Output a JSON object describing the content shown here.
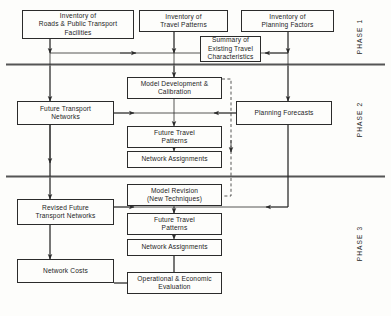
{
  "diagram": {
    "phases": [
      {
        "id": "phase1",
        "label": "PHASE 1"
      },
      {
        "id": "phase2",
        "label": "PHASE 2"
      },
      {
        "id": "phase3",
        "label": "PHASE 3"
      }
    ],
    "boxes": [
      {
        "id": "inventory_roads",
        "label": "Inventory of\nRoads & Public Transport\nFacilities",
        "line1": "Inventory of",
        "line2": "Roads & Public Transport",
        "line3": "Facilities",
        "x": 22,
        "y": 10,
        "w": 112,
        "h": 29
      },
      {
        "id": "inventory_travel",
        "label": "Inventory of\nTravel Patterns",
        "line1": "Inventory of",
        "line2": "Travel Patterns",
        "line3": "",
        "x": 139,
        "y": 10,
        "w": 89,
        "h": 22
      },
      {
        "id": "inventory_planning",
        "label": "Inventory of\nPlanning Factors",
        "line1": "Inventory of",
        "line2": "Planning Factors",
        "line3": "",
        "x": 241,
        "y": 10,
        "w": 93,
        "h": 22
      },
      {
        "id": "summary_existing",
        "label": "Summary of\nExisting Travel\nCharacteristics",
        "line1": "Summary of",
        "line2": "Existing Travel",
        "line3": "Characteristics",
        "x": 200,
        "y": 36,
        "w": 61,
        "h": 26
      },
      {
        "id": "model_dev",
        "label": "Model Development &\nCalibration",
        "line1": "Model Development &",
        "line2": "Calibration",
        "line3": "",
        "x": 127,
        "y": 77,
        "w": 95,
        "h": 22
      },
      {
        "id": "future_transport_networks",
        "label": "Future Transport\nNetworks",
        "line1": "Future Transport",
        "line2": "Networks",
        "line3": "",
        "x": 17,
        "y": 101,
        "w": 97,
        "h": 24
      },
      {
        "id": "planning_forecasts",
        "label": "Planning Forecasts",
        "line1": "Planning Forecasts",
        "line2": "",
        "line3": "",
        "x": 236,
        "y": 101,
        "w": 96,
        "h": 24
      },
      {
        "id": "future_travel_patterns_p2",
        "label": "Future Travel\nPatterns",
        "line1": "Future Travel",
        "line2": "Patterns",
        "line3": "",
        "x": 127,
        "y": 126,
        "w": 95,
        "h": 22
      },
      {
        "id": "network_assignments_p2",
        "label": "Network Assignments",
        "line1": "Network Assignments",
        "line2": "",
        "line3": "",
        "x": 127,
        "y": 151,
        "w": 95,
        "h": 17
      },
      {
        "id": "model_revision",
        "label": "Model Revision\n(New Techniques)",
        "line1": "Model Revision",
        "line2": "(New Techniques)",
        "line3": "",
        "x": 127,
        "y": 184,
        "w": 95,
        "h": 22
      },
      {
        "id": "revised_future_networks",
        "label": "Revised Future\nTransport Networks",
        "line1": "Revised Future",
        "line2": "Transport Networks",
        "line3": "",
        "x": 17,
        "y": 199,
        "w": 97,
        "h": 26
      },
      {
        "id": "future_travel_patterns_p3",
        "label": "Future Travel\nPatterns",
        "line1": "Future Travel",
        "line2": "Patterns",
        "line3": "",
        "x": 127,
        "y": 213,
        "w": 95,
        "h": 22
      },
      {
        "id": "network_assignments_p3",
        "label": "Network Assignments",
        "line1": "Network Assignments",
        "line2": "",
        "line3": "",
        "x": 127,
        "y": 239,
        "w": 95,
        "h": 17
      },
      {
        "id": "network_costs",
        "label": "Network Costs",
        "line1": "Network Costs",
        "line2": "",
        "line3": "",
        "x": 17,
        "y": 259,
        "w": 97,
        "h": 24
      },
      {
        "id": "operational_evaluation",
        "label": "Operational & Economic\nEvaluation",
        "line1": "Operational  &  Economic",
        "line2": "Evaluation",
        "line3": "",
        "x": 127,
        "y": 272,
        "w": 95,
        "h": 22
      }
    ],
    "colors": {
      "line": "#2b2b2b",
      "divider": "#555555",
      "background": "#fdfdfb",
      "text": "#1c1c1c"
    }
  }
}
